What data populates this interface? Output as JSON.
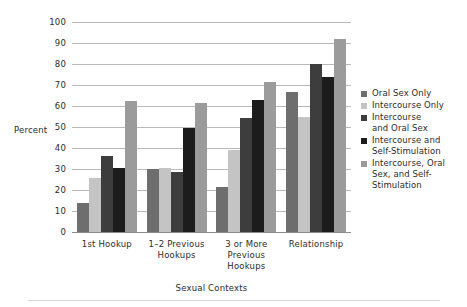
{
  "chart_data": {
    "type": "bar",
    "title": "",
    "xlabel": "Sexual Contexts",
    "ylabel": "Percent",
    "ylim": [
      0,
      100
    ],
    "ytick_step": 10,
    "yticks": [
      "100",
      "90",
      "80",
      "70",
      "60",
      "50",
      "40",
      "30",
      "20",
      "10",
      "0"
    ],
    "grid": true,
    "legend_position": "right",
    "categories": [
      "1st Hookup",
      "1–2 Previous Hookups",
      "3 or More Previous Hookups",
      "Relationship"
    ],
    "category_lines": [
      [
        "1st Hookup"
      ],
      [
        "1–2 Previous",
        "Hookups"
      ],
      [
        "3 or More",
        "Previous",
        "Hookups"
      ],
      [
        "Relationship"
      ]
    ],
    "series": [
      {
        "name": "Oral Sex Only",
        "label_lines": [
          "Oral Sex Only"
        ],
        "color": "#6e6e6e",
        "values": [
          14,
          30,
          21.5,
          66.5
        ]
      },
      {
        "name": "Intercourse Only",
        "label_lines": [
          "Intercourse Only"
        ],
        "color": "#c4c4c4",
        "values": [
          25.5,
          30.5,
          39,
          55
        ]
      },
      {
        "name": "Intercourse and Oral Sex",
        "label_lines": [
          "Intercourse",
          "and Oral Sex"
        ],
        "color": "#3d3d3d",
        "values": [
          36,
          28.5,
          54.5,
          80
        ]
      },
      {
        "name": "Intercourse and Self-Stimulation",
        "label_lines": [
          "Intercourse and",
          "Self-Stimulation"
        ],
        "color": "#1c1c1c",
        "values": [
          30.5,
          49.5,
          63,
          74
        ]
      },
      {
        "name": "Intercourse, Oral Sex, and Self-Stimulation",
        "label_lines": [
          "Intercourse, Oral",
          "Sex, and Self-",
          "Stimulation"
        ],
        "color": "#9b9b9b",
        "values": [
          62.5,
          61.5,
          71.5,
          92
        ]
      }
    ]
  }
}
